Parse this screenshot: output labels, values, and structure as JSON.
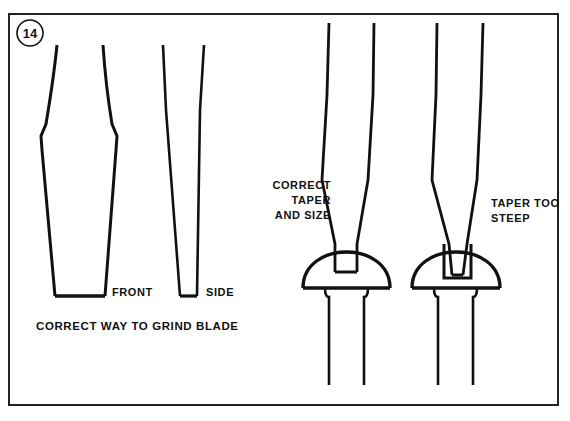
{
  "figure": {
    "number": "14",
    "background_color": "#ffffff",
    "ink_color": "#111111"
  },
  "labels": {
    "front_view": "FRONT",
    "side_view": "SIDE",
    "caption": "CORRECT WAY TO GRIND BLADE",
    "correct_callout_line1": "CORRECT",
    "correct_callout_line2": "TAPER",
    "correct_callout_line3": "AND SIZE",
    "steep_callout_line1": "TAPER TOO",
    "steep_callout_line2": "STEEP"
  },
  "diagram": {
    "type": "technical-line-drawing",
    "panels": [
      {
        "name": "front-view-blade",
        "label": "FRONT",
        "description": "Front elevation of ground screwdriver blade, waisted shank flaring to flat tip"
      },
      {
        "name": "side-view-blade",
        "label": "SIDE",
        "description": "Side elevation of ground screwdriver blade, narrow wedge taper to flat tip"
      },
      {
        "name": "correct-fit-screw",
        "label": "CORRECT TAPER AND SIZE",
        "description": "Blade with parallel flanks seated fully in round-head screw slot"
      },
      {
        "name": "steep-fit-screw",
        "label": "TAPER TOO STEEP",
        "description": "Blade with steep taper wedging in slot, contacting only near bottom"
      }
    ]
  }
}
